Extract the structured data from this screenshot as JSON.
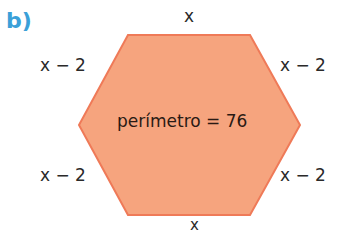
{
  "part_label": "b)",
  "shape": {
    "type": "hexagon",
    "fill": "#f6a47e",
    "stroke": "#ef7a58",
    "center_text": "perímetro = 76"
  },
  "sides": {
    "top": "x",
    "top_left": "x − 2",
    "top_right": "x − 2",
    "bottom_left": "x − 2",
    "bottom_right": "x − 2",
    "bottom": "x"
  }
}
